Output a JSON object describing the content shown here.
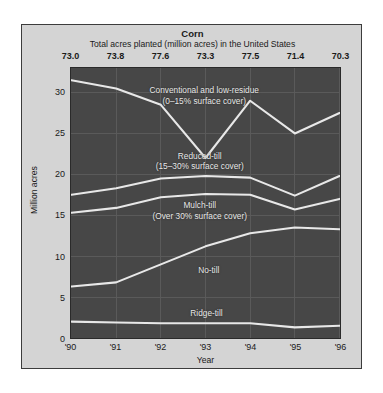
{
  "header": {
    "title": "Corn",
    "subtitle": "Total acres planted (million acres) in the United States"
  },
  "colors": {
    "page_background": "#ffffff",
    "panel_background": "#d4d4d4",
    "plot_background": "#474747",
    "line": "#e8e8e8",
    "gridline": "#5b5b5b",
    "text": "#1a1a1a",
    "plot_text": "#e8e8e8"
  },
  "chart_data": {
    "type": "area",
    "title": "Corn",
    "subtitle": "Total acres planted (million acres) in the United States",
    "xlabel": "Year",
    "ylabel": "Million acres",
    "ylim": [
      0,
      33
    ],
    "yticks": [
      0,
      5,
      10,
      15,
      20,
      25,
      30
    ],
    "ytick_labels": [
      "0",
      "5",
      "10",
      "15",
      "20",
      "25",
      "30"
    ],
    "categories": [
      "'90",
      "'91",
      "'92",
      "'93",
      "'94",
      "'95",
      "'96"
    ],
    "x": [
      1990,
      1991,
      1992,
      1993,
      1994,
      1995,
      1996
    ],
    "grid": true,
    "legend": "inline-annotations",
    "stacked": true,
    "secondary_axis": {
      "position": "top",
      "label": "Total acres planted (million acres) in the United States",
      "values": [
        73.0,
        73.8,
        77.6,
        73.3,
        77.5,
        71.4,
        70.3
      ],
      "tick_labels": [
        "73.0",
        "73.8",
        "77.6",
        "73.3",
        "77.5",
        "71.4",
        "70.3"
      ]
    },
    "series": [
      {
        "name": "Ridge-till",
        "label": "Ridge-till",
        "sublabel": "",
        "order": 1,
        "values": [
          2.0,
          1.9,
          1.8,
          1.8,
          1.8,
          1.3,
          1.5
        ],
        "cumulative_top": [
          2.0,
          1.9,
          1.8,
          1.8,
          1.8,
          1.3,
          1.5
        ]
      },
      {
        "name": "No-till",
        "label": "No-till",
        "sublabel": "",
        "order": 2,
        "values": [
          4.3,
          4.9,
          7.2,
          9.4,
          11.0,
          12.2,
          11.8
        ],
        "cumulative_top": [
          6.3,
          6.8,
          9.0,
          11.2,
          12.8,
          13.5,
          13.3
        ]
      },
      {
        "name": "Mulch-till",
        "label": "Mulch-till",
        "sublabel": "(Over 30% surface cover)",
        "order": 3,
        "values": [
          9.0,
          9.1,
          8.2,
          6.4,
          4.7,
          2.2,
          3.7
        ],
        "cumulative_top": [
          15.3,
          15.9,
          17.2,
          17.6,
          17.5,
          15.7,
          17.0
        ]
      },
      {
        "name": "Reduced-till",
        "label": "Reduced-till",
        "sublabel": "(15–30% surface cover)",
        "order": 4,
        "values": [
          2.2,
          2.4,
          2.3,
          2.2,
          2.1,
          1.7,
          2.8
        ],
        "cumulative_top": [
          17.5,
          18.3,
          19.5,
          19.8,
          19.6,
          17.4,
          19.8
        ]
      },
      {
        "name": "Conventional and low-residue",
        "label": "Conventional and low-residue",
        "sublabel": "(0–15% surface cover)",
        "order": 5,
        "values": [
          14.0,
          12.2,
          9.0,
          2.2,
          9.4,
          7.6,
          7.7
        ],
        "cumulative_top": [
          31.5,
          30.5,
          28.5,
          22.0,
          29.0,
          25.0,
          27.5
        ]
      }
    ],
    "annotations": [
      {
        "text": "Conventional and low-residue",
        "sub": "(0–15% surface cover)"
      },
      {
        "text": "Reduced-till",
        "sub": "(15–30% surface cover)"
      },
      {
        "text": "Mulch-till",
        "sub": "(Over 30% surface cover)"
      },
      {
        "text": "No-till",
        "sub": ""
      },
      {
        "text": "Ridge-till",
        "sub": ""
      }
    ]
  }
}
